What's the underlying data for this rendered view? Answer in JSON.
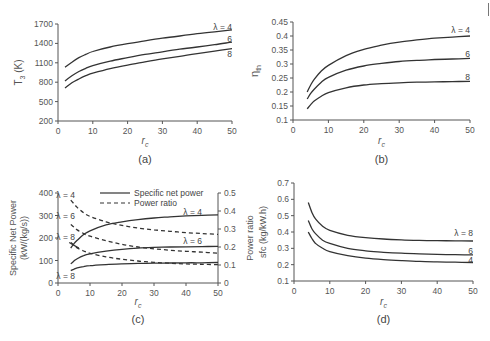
{
  "figure": {
    "panels": [
      "(a)",
      "(b)",
      "(c)",
      "(d)"
    ]
  },
  "chart_data": [
    {
      "id": "a",
      "type": "line",
      "panel_label": "(a)",
      "title": "",
      "xlabel": "r_c",
      "ylabel": "T_3 (K)",
      "xlim": [
        0,
        50
      ],
      "ylim": [
        200,
        1700
      ],
      "xticks": [
        0,
        10,
        20,
        30,
        40,
        50
      ],
      "yticks": [
        200,
        500,
        800,
        1100,
        1400,
        1700
      ],
      "grid": false,
      "x": [
        2,
        4,
        6,
        8,
        10,
        15,
        20,
        25,
        30,
        35,
        40,
        45,
        50
      ],
      "series": [
        {
          "name": "λ = 4",
          "label": "λ = 4",
          "values": [
            1030,
            1110,
            1180,
            1230,
            1275,
            1345,
            1395,
            1440,
            1480,
            1515,
            1550,
            1580,
            1610
          ]
        },
        {
          "name": "6",
          "label": "6",
          "values": [
            820,
            900,
            965,
            1015,
            1055,
            1125,
            1180,
            1230,
            1270,
            1310,
            1345,
            1380,
            1420
          ]
        },
        {
          "name": "8",
          "label": "8",
          "values": [
            710,
            790,
            850,
            900,
            940,
            1010,
            1065,
            1115,
            1160,
            1200,
            1240,
            1280,
            1320
          ]
        }
      ]
    },
    {
      "id": "b",
      "type": "line",
      "panel_label": "(b)",
      "title": "",
      "xlabel": "r_c",
      "ylabel": "η_th",
      "xlim": [
        0,
        50
      ],
      "ylim": [
        0.1,
        0.45
      ],
      "xticks": [
        0,
        10,
        20,
        30,
        40,
        50
      ],
      "yticks": [
        0.1,
        0.15,
        0.2,
        0.25,
        0.3,
        0.35,
        0.4,
        0.45
      ],
      "grid": false,
      "x": [
        4,
        5,
        6,
        8,
        10,
        15,
        20,
        25,
        30,
        35,
        40,
        45,
        50
      ],
      "series": [
        {
          "name": "λ = 4",
          "label": "λ = 4",
          "values": [
            0.2,
            0.225,
            0.245,
            0.275,
            0.295,
            0.33,
            0.352,
            0.367,
            0.378,
            0.386,
            0.392,
            0.396,
            0.4
          ]
        },
        {
          "name": "6",
          "label": "6",
          "values": [
            0.175,
            0.195,
            0.21,
            0.235,
            0.252,
            0.278,
            0.293,
            0.302,
            0.309,
            0.313,
            0.316,
            0.318,
            0.32
          ]
        },
        {
          "name": "8",
          "label": "8",
          "values": [
            0.14,
            0.155,
            0.168,
            0.185,
            0.198,
            0.215,
            0.225,
            0.23,
            0.233,
            0.235,
            0.236,
            0.237,
            0.238
          ]
        }
      ]
    },
    {
      "id": "c",
      "type": "line",
      "panel_label": "(c)",
      "title": "",
      "xlabel": "r_c",
      "ylabel": "Specific Net Power (kW/(kg/s))",
      "ylabel2": "Power ratio",
      "xlim": [
        0,
        50
      ],
      "ylim": [
        0,
        400
      ],
      "ylim2": [
        0,
        0.5
      ],
      "xticks": [
        0,
        10,
        20,
        30,
        40,
        50
      ],
      "yticks": [
        0,
        100,
        200,
        300,
        400
      ],
      "yticks2": [
        0,
        0.1,
        0.2,
        0.3,
        0.4,
        0.5
      ],
      "grid": false,
      "legend": {
        "position": "upper center",
        "entries": [
          {
            "label": "Specific net power",
            "style": "solid"
          },
          {
            "label": "Power ratio",
            "style": "dashed"
          }
        ]
      },
      "x": [
        4,
        5,
        6,
        8,
        10,
        15,
        20,
        25,
        30,
        35,
        40,
        45,
        50
      ],
      "series": [
        {
          "name": "Specific net power λ = 4",
          "axis": "left",
          "style": "solid",
          "label": "λ = 4",
          "values": [
            155,
            175,
            190,
            215,
            232,
            258,
            272,
            282,
            289,
            294,
            298,
            301,
            303
          ]
        },
        {
          "name": "Specific net power λ = 6",
          "axis": "left",
          "style": "solid",
          "label": "λ = 6",
          "values": [
            85,
            98,
            108,
            122,
            130,
            142,
            150,
            155,
            158,
            160,
            161,
            162,
            163
          ]
        },
        {
          "name": "Specific net power λ = 8",
          "axis": "left",
          "style": "solid",
          "label": "λ = 8",
          "values": [
            55,
            62,
            67,
            73,
            77,
            82,
            85,
            87,
            88,
            89,
            90,
            90,
            91
          ]
        },
        {
          "name": "Power ratio λ = 4",
          "axis": "right",
          "style": "dashed",
          "label": "λ = 4",
          "values": [
            0.46,
            0.44,
            0.42,
            0.39,
            0.37,
            0.34,
            0.32,
            0.305,
            0.295,
            0.287,
            0.28,
            0.275,
            0.27
          ]
        },
        {
          "name": "Power ratio λ = 6",
          "axis": "right",
          "style": "dashed",
          "label": "λ = 6",
          "values": [
            0.325,
            0.31,
            0.295,
            0.275,
            0.26,
            0.235,
            0.215,
            0.2,
            0.19,
            0.182,
            0.176,
            0.171,
            0.166
          ]
        },
        {
          "name": "Power ratio λ = 8",
          "axis": "right",
          "style": "dashed",
          "label": "λ = 8",
          "values": [
            0.225,
            0.21,
            0.195,
            0.178,
            0.165,
            0.145,
            0.132,
            0.122,
            0.115,
            0.11,
            0.106,
            0.104,
            0.102
          ]
        }
      ]
    },
    {
      "id": "d",
      "type": "line",
      "panel_label": "(d)",
      "title": "",
      "xlabel": "r_c",
      "ylabel": "sfc (kg/kW.h)",
      "xlim": [
        0,
        50
      ],
      "ylim": [
        0.1,
        0.7
      ],
      "xticks": [
        0,
        10,
        20,
        30,
        40,
        50
      ],
      "yticks": [
        0.1,
        0.2,
        0.3,
        0.4,
        0.5,
        0.6,
        0.7
      ],
      "grid": false,
      "x": [
        4,
        5,
        6,
        8,
        10,
        15,
        20,
        25,
        30,
        35,
        40,
        45,
        50
      ],
      "series": [
        {
          "name": "λ = 8",
          "label": "λ = 8",
          "values": [
            0.58,
            0.52,
            0.48,
            0.435,
            0.41,
            0.38,
            0.365,
            0.357,
            0.352,
            0.349,
            0.347,
            0.346,
            0.345
          ]
        },
        {
          "name": "6",
          "label": "6",
          "values": [
            0.47,
            0.42,
            0.39,
            0.35,
            0.33,
            0.3,
            0.285,
            0.276,
            0.27,
            0.266,
            0.263,
            0.261,
            0.26
          ]
        },
        {
          "name": "4",
          "label": "4",
          "values": [
            0.4,
            0.36,
            0.33,
            0.3,
            0.28,
            0.255,
            0.24,
            0.231,
            0.225,
            0.22,
            0.217,
            0.215,
            0.213
          ]
        }
      ]
    }
  ]
}
